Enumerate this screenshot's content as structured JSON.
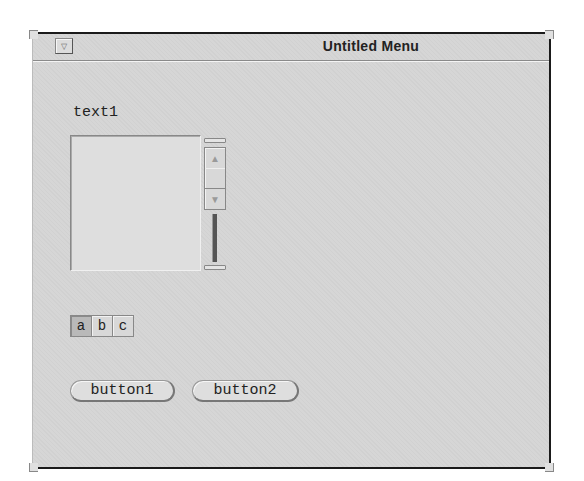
{
  "window": {
    "title": "Untitled Menu",
    "menu_button_icon": "triangle-down"
  },
  "text_area": {
    "label": "text1",
    "value": ""
  },
  "scrollbar": {
    "up_icon": "▲",
    "down_icon": "▼"
  },
  "segmented": {
    "items": [
      {
        "label": "a",
        "selected": true
      },
      {
        "label": "b",
        "selected": false
      },
      {
        "label": "c",
        "selected": false
      }
    ]
  },
  "buttons": {
    "button1": "button1",
    "button2": "button2"
  }
}
